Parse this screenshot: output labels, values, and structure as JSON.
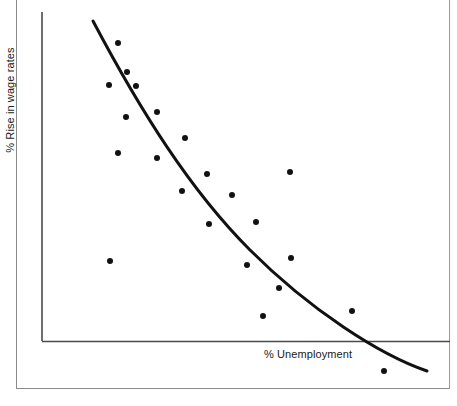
{
  "figure": {
    "kind": "scatter-with-fitted-curve",
    "background_color": "#ffffff",
    "frame_color": "#8a8a8a",
    "axis_color": "#4a4a4a",
    "ink_color": "#111111"
  },
  "axes": {
    "x_axis": {
      "name": "x-axis-line",
      "y": 341,
      "x_start": 42,
      "x_end": 450
    },
    "y_axis": {
      "name": "y-axis-line",
      "x": 42,
      "y_start": 12,
      "y_end": 341
    }
  },
  "chart_data": {
    "type": "scatter",
    "title": "",
    "subtitle": "",
    "xlabel": "% Unemployment",
    "ylabel": "% Rise in wage rates",
    "xtick_labels": [],
    "ytick_labels": [],
    "xlim": [
      0,
      100
    ],
    "ylim": [
      0,
      100
    ],
    "grid": false,
    "legend": false,
    "legend_position": "none",
    "annotations": [],
    "series": [
      {
        "name": "Observations",
        "marker": "filled-circle",
        "marker_color": "#111111",
        "marker_size_px": 6,
        "points": [
          {
            "px": 118,
            "py": 43
          },
          {
            "px": 127,
            "py": 72
          },
          {
            "px": 109,
            "py": 85
          },
          {
            "px": 136,
            "py": 86
          },
          {
            "px": 126,
            "py": 117
          },
          {
            "px": 157,
            "py": 112
          },
          {
            "px": 185,
            "py": 138
          },
          {
            "px": 118,
            "py": 153
          },
          {
            "px": 157,
            "py": 158
          },
          {
            "px": 207,
            "py": 174
          },
          {
            "px": 182,
            "py": 191
          },
          {
            "px": 232,
            "py": 195
          },
          {
            "px": 290,
            "py": 172
          },
          {
            "px": 209,
            "py": 224
          },
          {
            "px": 256,
            "py": 222
          },
          {
            "px": 110,
            "py": 261
          },
          {
            "px": 247,
            "py": 265
          },
          {
            "px": 291,
            "py": 258
          },
          {
            "px": 279,
            "py": 288
          },
          {
            "px": 263,
            "py": 316
          },
          {
            "px": 352,
            "py": 311
          },
          {
            "px": 384,
            "py": 371
          }
        ]
      }
    ],
    "fitted_curve": {
      "name": "Phillips curve",
      "stroke_color": "#111111",
      "stroke_width_px": 3,
      "path": "M 93 21 C 140 110 190 190 250 250 C 310 310 380 355 427 371"
    }
  },
  "labels": {
    "y_axis_text": "% Rise in wage rates",
    "x_axis_text": "% Unemployment"
  }
}
